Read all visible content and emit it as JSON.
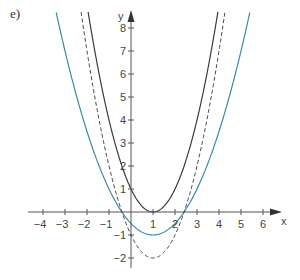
{
  "panel_label": "e)",
  "colors": {
    "axis": "#555555",
    "black_curve": "#3a3a3a",
    "blue_curve": "#3d8aa8",
    "dashed_curve": "#4a4a4a"
  },
  "chart_data": {
    "type": "line",
    "title": "",
    "xlabel": "x",
    "ylabel": "y",
    "xlim": [
      -4.5,
      6.8
    ],
    "ylim": [
      -2.4,
      8.7
    ],
    "x_ticks": [
      -4,
      -3,
      -2,
      -1,
      1,
      2,
      3,
      4,
      5,
      6
    ],
    "y_ticks": [
      -2,
      -1,
      1,
      2,
      3,
      4,
      5,
      6,
      7,
      8
    ],
    "grid": false,
    "legend": null,
    "series": [
      {
        "name": "y = (x - 1)^2",
        "style": "solid",
        "color": "#3a3a3a",
        "vertex": [
          1,
          0
        ],
        "a": 1,
        "h": 1,
        "k": 0,
        "x": [
          -1.95,
          -1,
          0,
          1,
          2,
          3,
          3.95
        ],
        "values": [
          8.7,
          4,
          1,
          0,
          1,
          4,
          8.7
        ]
      },
      {
        "name": "y = 0.5(x - 1)^2 - 1",
        "style": "solid",
        "color": "#3d8aa8",
        "vertex": [
          1,
          -1
        ],
        "a": 0.5,
        "h": 1,
        "k": -1,
        "x": [
          -3.4,
          -3,
          -2,
          -1,
          0,
          1,
          2,
          3,
          4,
          5,
          5.4
        ],
        "values": [
          8.68,
          7,
          3.5,
          1,
          -0.5,
          -1,
          -0.5,
          1,
          3.5,
          7,
          8.68
        ]
      },
      {
        "name": "y = (x - 1)^2 - 2",
        "style": "dashed",
        "color": "#4a4a4a",
        "vertex": [
          1,
          -2
        ],
        "a": 1,
        "h": 1,
        "k": -2,
        "x": [
          -2.27,
          -2,
          -1,
          0,
          1,
          2,
          3,
          4,
          4.27
        ],
        "values": [
          8.69,
          7,
          2,
          -1,
          -2,
          -1,
          2,
          7,
          8.69
        ]
      }
    ]
  }
}
